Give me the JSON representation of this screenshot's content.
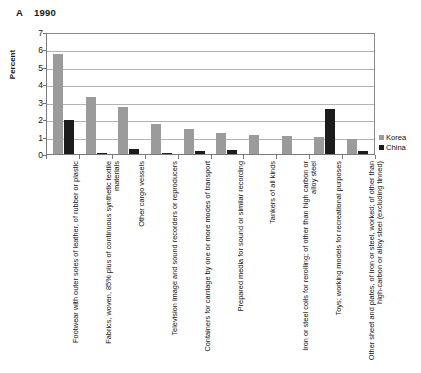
{
  "title": {
    "panel_letter": "A",
    "year": "1990"
  },
  "legend": {
    "position": "right",
    "entries": [
      {
        "label": "Korea",
        "color": "#9b9b9b"
      },
      {
        "label": "China",
        "color": "#1c1c1c"
      }
    ]
  },
  "axes": {
    "ylabel": "Percent",
    "yticks": [
      "0",
      "1",
      "2",
      "3",
      "4",
      "5",
      "6",
      "7"
    ]
  },
  "chart_data": {
    "type": "bar",
    "xlabel": "",
    "ylabel": "Percent",
    "ylim": [
      0,
      7
    ],
    "yticks": [
      0,
      1,
      2,
      3,
      4,
      5,
      6,
      7
    ],
    "grid": true,
    "legend_position": "right",
    "categories": [
      "Footwear with outer soles of leather, of rubber or plastic",
      "Fabrics, woven, 85% plus of continuous synthetic textile materials",
      "Other cargo vessels",
      "Television image and sound recorders or reproducers",
      "Containers for carriage by one or more modes of transport",
      "Prepared media for sound or similar recording",
      "Tankers of all kinds",
      "Iron or steel coils for rerolling; of other than high carbon or alloy steel",
      "Toys; working models for recreational purposes",
      "Other sheet and plates, of iron or steel, worked; of other than high-carbon or alloy steel (excluding tinned)"
    ],
    "series": [
      {
        "name": "Korea",
        "color": "#9b9b9b",
        "values": [
          5.75,
          3.3,
          2.7,
          1.75,
          1.45,
          1.2,
          1.1,
          1.05,
          1.0,
          0.85
        ]
      },
      {
        "name": "China",
        "color": "#1c1c1c",
        "values": [
          1.95,
          0.05,
          0.3,
          0.05,
          0.15,
          0.25,
          0.0,
          0.0,
          2.6,
          0.15
        ]
      }
    ]
  }
}
